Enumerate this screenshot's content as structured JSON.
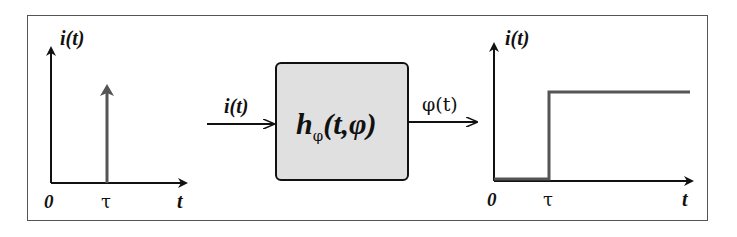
{
  "left_plot": {
    "y_label": "i(t)",
    "x_label": "t",
    "origin_label": "0",
    "tick_label": "τ",
    "signal": "impulse"
  },
  "input_label": "i(t)",
  "system_block": {
    "main": "h",
    "subscript": "φ",
    "args": "(t,φ)",
    "fill": "#e0e0e0"
  },
  "output_label": "φ(t)",
  "right_plot": {
    "y_label": "i(t)",
    "x_label": "t",
    "origin_label": "0",
    "tick_label": "τ",
    "signal": "step"
  },
  "colors": {
    "axis": "#111111",
    "signal": "#555555",
    "border": "#555555"
  }
}
